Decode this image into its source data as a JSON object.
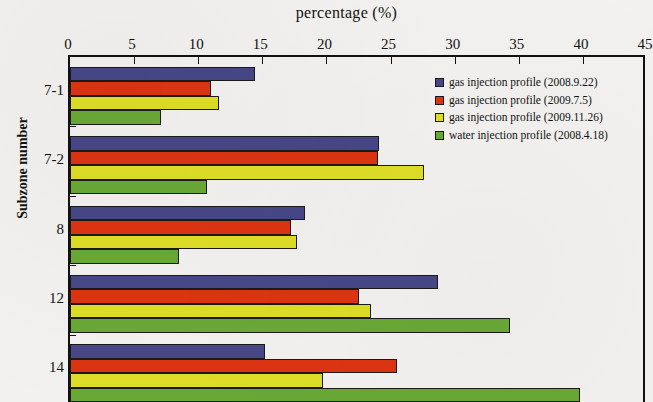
{
  "chart_data": {
    "type": "bar",
    "orientation": "horizontal",
    "title": "percentage (%)",
    "xlabel": "percentage (%)",
    "ylabel": "Subzone number",
    "xlim": [
      0,
      45
    ],
    "xticks": [
      0,
      5,
      10,
      15,
      20,
      25,
      30,
      35,
      40,
      45
    ],
    "xtick_labels": [
      "0",
      "5",
      "10",
      "15",
      "20",
      "25",
      "30",
      "35",
      "40",
      "45"
    ],
    "grid": false,
    "legend_position": "upper right",
    "categories": [
      "7-1",
      "7-2",
      "8",
      "12",
      "14"
    ],
    "series": [
      {
        "name": "gas injection profile (2008.9.22)",
        "color": "#474787",
        "values": [
          14.4,
          24.1,
          18.3,
          28.7,
          15.2
        ]
      },
      {
        "name": "gas injection profile (2009.7.5)",
        "color": "#dc3412",
        "values": [
          11.0,
          24.0,
          17.2,
          22.5,
          25.5
        ]
      },
      {
        "name": "gas injection profile (2009.11.26)",
        "color": "#dede27",
        "values": [
          11.6,
          27.6,
          17.7,
          23.5,
          19.7
        ]
      },
      {
        "name": "water injection profile (2008.4.18)",
        "color": "#69a835",
        "values": [
          7.1,
          10.7,
          8.5,
          34.3,
          39.8
        ]
      }
    ]
  },
  "legend": {
    "items": [
      {
        "label": "gas injection profile (2008.9.22)",
        "color": "#474787"
      },
      {
        "label": "gas injection profile (2009.7.5)",
        "color": "#dc3412"
      },
      {
        "label": "gas injection profile (2009.11.26)",
        "color": "#dede27"
      },
      {
        "label": "water injection profile (2008.4.18)",
        "color": "#69a835"
      }
    ]
  }
}
